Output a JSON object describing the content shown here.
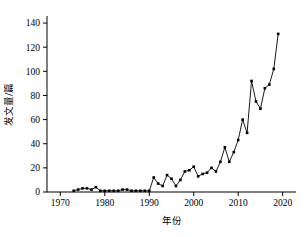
{
  "chart_data": {
    "type": "line",
    "title": "",
    "subtitle": "",
    "xlabel": "年份",
    "ylabel": "发文量/篇",
    "xlim": [
      1967,
      2023
    ],
    "ylim": [
      0,
      145
    ],
    "xticks": [
      1970,
      1980,
      1990,
      2000,
      2010,
      2020
    ],
    "xtick_labels": [
      "1970",
      "1980",
      "1990",
      "2000",
      "2010",
      "2020"
    ],
    "yticks": [
      0,
      20,
      40,
      60,
      80,
      100,
      120,
      140
    ],
    "ytick_labels": [
      "0",
      "20",
      "40",
      "60",
      "80",
      "100",
      "120",
      "140"
    ],
    "grid": false,
    "legend": null,
    "marker": "square",
    "line_color": "#000000",
    "marker_color": "#000000",
    "x": [
      1973,
      1974,
      1975,
      1976,
      1977,
      1978,
      1979,
      1980,
      1981,
      1982,
      1983,
      1984,
      1985,
      1986,
      1987,
      1988,
      1989,
      1990,
      1991,
      1992,
      1993,
      1994,
      1995,
      1996,
      1997,
      1998,
      1999,
      2000,
      2001,
      2002,
      2003,
      2004,
      2005,
      2006,
      2007,
      2008,
      2009,
      2010,
      2011,
      2012,
      2013,
      2014,
      2015,
      2016,
      2017,
      2018,
      2019
    ],
    "values": [
      1,
      2,
      3,
      3,
      2,
      4,
      1,
      1,
      1,
      1,
      1,
      2,
      2,
      1,
      1,
      1,
      1,
      1,
      12,
      7,
      5,
      14,
      11,
      5,
      10,
      17,
      18,
      21,
      13,
      15,
      16,
      20,
      17,
      25,
      37,
      25,
      33,
      43,
      60,
      49,
      92,
      75,
      69,
      86,
      89,
      102,
      131
    ],
    "series": [
      {
        "name": "发文量",
        "values": [
          1,
          2,
          3,
          3,
          2,
          4,
          1,
          1,
          1,
          1,
          1,
          2,
          2,
          1,
          1,
          1,
          1,
          1,
          12,
          7,
          5,
          14,
          11,
          5,
          10,
          17,
          18,
          21,
          13,
          15,
          16,
          20,
          17,
          25,
          37,
          25,
          33,
          43,
          60,
          49,
          92,
          75,
          69,
          86,
          89,
          102,
          131
        ]
      }
    ]
  },
  "figure": {
    "background_color": "#ffffff",
    "axis_color": "#000000"
  }
}
